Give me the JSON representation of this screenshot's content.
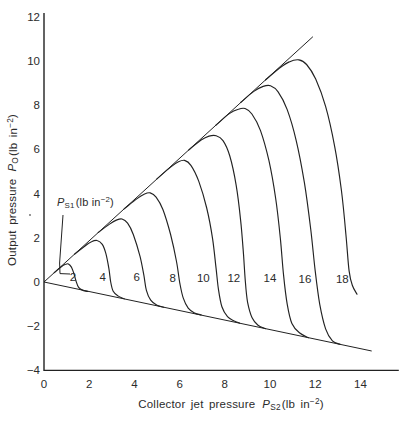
{
  "figure": {
    "background": "#ffffff",
    "line_color": "#222222",
    "text_color": "#2b2b2b"
  },
  "chart_data": {
    "type": "line",
    "title": "",
    "xlabel": "Collector jet pressure P_S2 (lb in−2)",
    "ylabel": "Output pressure P_O (lb in−2)",
    "xlim": [
      0,
      15.7
    ],
    "ylim": [
      -4,
      12.2
    ],
    "grid": false,
    "legend": "none",
    "x_axis_title": {
      "text": "Collector jet pressure",
      "symbol": "P",
      "symbol_sub": "S2",
      "units_open": "(lb in",
      "units_exp": "−2",
      "units_close": ")"
    },
    "y_axis_title": {
      "text": "Output pressure",
      "symbol": "P",
      "symbol_sub": "O",
      "units_open": "(lb in",
      "units_exp": "−2",
      "units_close": ")"
    },
    "x_ticks": [
      {
        "label": "0",
        "value": 0
      },
      {
        "label": "2",
        "value": 2
      },
      {
        "label": "4",
        "value": 4
      },
      {
        "label": "6",
        "value": 6
      },
      {
        "label": "8",
        "value": 8
      },
      {
        "label": "10",
        "value": 10
      },
      {
        "label": "12",
        "value": 12
      },
      {
        "label": "14",
        "value": 14
      }
    ],
    "y_ticks": [
      {
        "label": "12",
        "value": 12
      },
      {
        "label": "10",
        "value": 10
      },
      {
        "label": "8",
        "value": 8
      },
      {
        "label": "6",
        "value": 6
      },
      {
        "label": "4",
        "value": 4
      },
      {
        "label": "2",
        "value": 2
      },
      {
        "label": "0",
        "value": 0
      },
      {
        "label": "−2",
        "value": -2
      },
      {
        "label": "−4",
        "value": -4
      }
    ],
    "family_annotation": {
      "symbol": "P",
      "symbol_sub": "S1",
      "units_open": "(lb in",
      "units_exp": "−2",
      "units_close": ")",
      "pos": [
        0.58,
        3.92
      ],
      "leader": [
        [
          0.84,
          3.03
        ],
        [
          0.69,
          0.86
        ],
        [
          0.71,
          0.38
        ],
        [
          1.15,
          0.36
        ]
      ]
    },
    "envelopes": [
      {
        "name": "upper-saturation-line",
        "points": [
          [
            0,
            0
          ],
          [
            11.9,
            11.1
          ]
        ]
      },
      {
        "name": "lower-saturation-line",
        "points": [
          [
            0,
            0
          ],
          [
            14.5,
            -3.12
          ]
        ]
      }
    ],
    "series": [
      {
        "name": "P_S1 = 2",
        "ps1": 2,
        "label": "2",
        "label_pos": [
          1.28,
          0.23
        ],
        "points": [
          [
            0.45,
            0.42
          ],
          [
            0.75,
            0.68
          ],
          [
            0.95,
            0.8
          ],
          [
            1.08,
            0.82
          ],
          [
            1.22,
            0.66
          ],
          [
            1.33,
            0.36
          ],
          [
            1.42,
            0.03
          ],
          [
            1.53,
            -0.24
          ],
          [
            1.72,
            -0.38
          ],
          [
            1.95,
            -0.43
          ]
        ]
      },
      {
        "name": "P_S1 = 4",
        "ps1": 4,
        "label": "4",
        "label_pos": [
          2.6,
          0.23
        ],
        "points": [
          [
            1.35,
            1.26
          ],
          [
            1.8,
            1.62
          ],
          [
            2.1,
            1.82
          ],
          [
            2.35,
            1.88
          ],
          [
            2.58,
            1.7
          ],
          [
            2.74,
            1.28
          ],
          [
            2.87,
            0.6
          ],
          [
            2.95,
            0.0
          ],
          [
            3.06,
            -0.42
          ],
          [
            3.27,
            -0.63
          ],
          [
            3.55,
            -0.76
          ]
        ]
      },
      {
        "name": "P_S1 = 6",
        "ps1": 6,
        "label": "6",
        "label_pos": [
          4.1,
          0.23
        ],
        "points": [
          [
            2.4,
            2.24
          ],
          [
            2.9,
            2.62
          ],
          [
            3.2,
            2.8
          ],
          [
            3.45,
            2.85
          ],
          [
            3.7,
            2.66
          ],
          [
            3.95,
            2.15
          ],
          [
            4.25,
            1.15
          ],
          [
            4.42,
            0.3
          ],
          [
            4.53,
            -0.38
          ],
          [
            4.72,
            -0.82
          ],
          [
            5.0,
            -1.05
          ],
          [
            5.3,
            -1.14
          ]
        ]
      },
      {
        "name": "P_S1 = 8",
        "ps1": 8,
        "label": "8",
        "label_pos": [
          5.7,
          0.2
        ],
        "points": [
          [
            3.55,
            3.31
          ],
          [
            4.1,
            3.76
          ],
          [
            4.45,
            3.98
          ],
          [
            4.7,
            4.03
          ],
          [
            4.96,
            3.84
          ],
          [
            5.26,
            3.28
          ],
          [
            5.6,
            2.15
          ],
          [
            5.86,
            0.95
          ],
          [
            6.01,
            -0.05
          ],
          [
            6.16,
            -0.72
          ],
          [
            6.38,
            -1.18
          ],
          [
            6.66,
            -1.4
          ],
          [
            6.95,
            -1.49
          ]
        ]
      },
      {
        "name": "P_S1 = 10",
        "ps1": 10,
        "label": "10",
        "label_pos": [
          7.05,
          0.18
        ],
        "points": [
          [
            5.0,
            4.67
          ],
          [
            5.6,
            5.2
          ],
          [
            5.95,
            5.44
          ],
          [
            6.22,
            5.5
          ],
          [
            6.5,
            5.28
          ],
          [
            6.85,
            4.55
          ],
          [
            7.2,
            3.35
          ],
          [
            7.46,
            1.95
          ],
          [
            7.61,
            0.65
          ],
          [
            7.72,
            -0.35
          ],
          [
            7.87,
            -1.12
          ],
          [
            8.12,
            -1.57
          ],
          [
            8.4,
            -1.75
          ],
          [
            8.65,
            -1.86
          ]
        ]
      },
      {
        "name": "P_S1 = 12",
        "ps1": 12,
        "label": "12",
        "label_pos": [
          8.4,
          0.18
        ],
        "points": [
          [
            6.4,
            5.97
          ],
          [
            6.95,
            6.42
          ],
          [
            7.3,
            6.6
          ],
          [
            7.62,
            6.62
          ],
          [
            7.92,
            6.4
          ],
          [
            8.22,
            5.7
          ],
          [
            8.5,
            4.4
          ],
          [
            8.7,
            2.8
          ],
          [
            8.83,
            1.2
          ],
          [
            8.91,
            0.0
          ],
          [
            9.01,
            -0.92
          ],
          [
            9.21,
            -1.62
          ],
          [
            9.47,
            -1.96
          ],
          [
            9.8,
            -2.11
          ]
        ]
      },
      {
        "name": "P_S1 = 14",
        "ps1": 14,
        "label": "14",
        "label_pos": [
          10.0,
          0.18
        ],
        "points": [
          [
            7.6,
            7.09
          ],
          [
            8.2,
            7.62
          ],
          [
            8.6,
            7.82
          ],
          [
            8.9,
            7.85
          ],
          [
            9.2,
            7.6
          ],
          [
            9.58,
            6.85
          ],
          [
            9.95,
            5.5
          ],
          [
            10.25,
            3.8
          ],
          [
            10.46,
            1.95
          ],
          [
            10.6,
            0.3
          ],
          [
            10.76,
            -1.0
          ],
          [
            10.97,
            -1.88
          ],
          [
            11.3,
            -2.3
          ],
          [
            11.7,
            -2.52
          ]
        ]
      },
      {
        "name": "P_S1 = 16",
        "ps1": 16,
        "label": "16",
        "label_pos": [
          11.55,
          0.15
        ],
        "points": [
          [
            8.7,
            8.12
          ],
          [
            9.3,
            8.64
          ],
          [
            9.7,
            8.85
          ],
          [
            10.02,
            8.88
          ],
          [
            10.36,
            8.6
          ],
          [
            10.76,
            7.8
          ],
          [
            11.16,
            6.4
          ],
          [
            11.52,
            4.5
          ],
          [
            11.8,
            2.4
          ],
          [
            12.0,
            0.5
          ],
          [
            12.2,
            -1.0
          ],
          [
            12.46,
            -2.12
          ],
          [
            12.76,
            -2.66
          ],
          [
            13.1,
            -2.82
          ]
        ]
      },
      {
        "name": "P_S1 = 18",
        "ps1": 18,
        "label": "18",
        "label_pos": [
          13.2,
          0.15
        ],
        "points": [
          [
            9.8,
            9.14
          ],
          [
            10.4,
            9.66
          ],
          [
            10.85,
            9.96
          ],
          [
            11.28,
            10.05
          ],
          [
            11.62,
            9.84
          ],
          [
            12.02,
            9.18
          ],
          [
            12.46,
            7.95
          ],
          [
            12.86,
            6.15
          ],
          [
            13.16,
            4.15
          ],
          [
            13.36,
            2.15
          ],
          [
            13.5,
            0.5
          ],
          [
            13.64,
            -0.15
          ],
          [
            13.85,
            -0.55
          ]
        ]
      }
    ]
  }
}
